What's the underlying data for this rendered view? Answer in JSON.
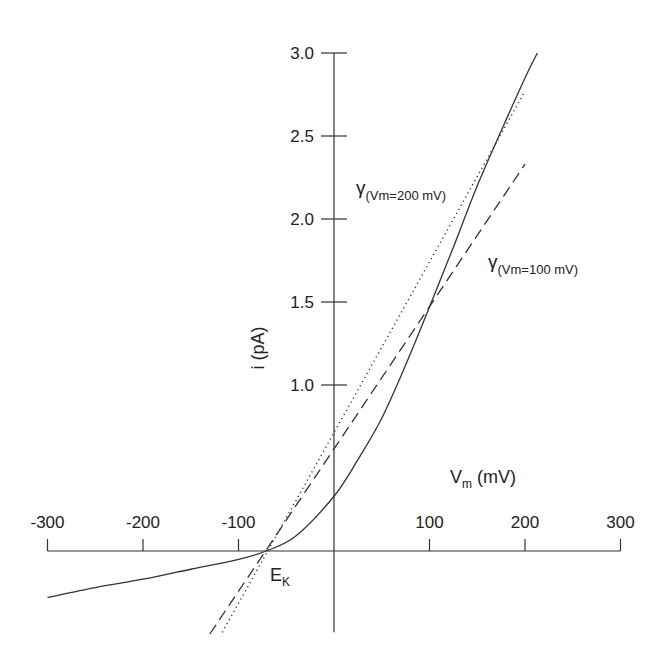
{
  "chart_data": {
    "type": "line",
    "title": "",
    "xlabel": "V",
    "xlabel_sub": "m",
    "xlabel_unit": " (mV)",
    "ylabel": "i (pA)",
    "xlim": [
      -300,
      300
    ],
    "ylim": [
      -0.5,
      3.0
    ],
    "x_ticks": [
      -300,
      -200,
      -100,
      100,
      200,
      300
    ],
    "x_tick_labels": [
      "-300",
      "-200",
      "-100",
      "100",
      "200",
      "300"
    ],
    "y_ticks": [
      1.0,
      1.5,
      2.0,
      2.5,
      3.0
    ],
    "y_tick_labels": [
      "1.0",
      "1.5",
      "2.0",
      "2.5",
      "3.0"
    ],
    "grid": false,
    "series": [
      {
        "name": "i-V relation",
        "style": "solid",
        "x": [
          -300,
          -250,
          -200,
          -150,
          -100,
          -71,
          -40,
          0,
          25,
          50,
          75,
          100,
          125,
          150,
          175,
          200,
          213
        ],
        "y": [
          -0.28,
          -0.22,
          -0.17,
          -0.11,
          -0.05,
          0.0,
          0.09,
          0.33,
          0.55,
          0.8,
          1.12,
          1.47,
          1.83,
          2.2,
          2.53,
          2.85,
          3.0
        ]
      },
      {
        "name": "chord conductance at Vm=100 mV",
        "style": "dashed",
        "x": [
          -130,
          200
        ],
        "y": [
          -0.5,
          2.33
        ]
      },
      {
        "name": "chord conductance at Vm=200 mV",
        "style": "dotted",
        "x": [
          -117,
          200
        ],
        "y": [
          -0.49,
          2.77
        ]
      }
    ],
    "annotations": [
      {
        "symbol": "γ",
        "subscript": "(Vm=200 mV)",
        "refers_to": "dotted"
      },
      {
        "symbol": "γ",
        "subscript": "(Vm=100 mV)",
        "refers_to": "dashed"
      },
      {
        "symbol": "E",
        "subscript": "K",
        "at_x": -71,
        "at_y": 0
      }
    ]
  }
}
